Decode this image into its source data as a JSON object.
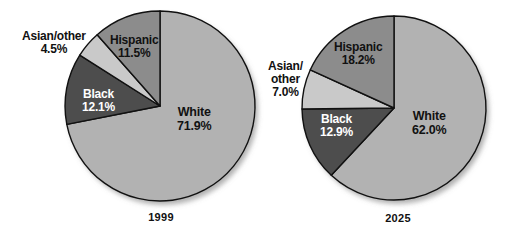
{
  "figure": {
    "background": "#ffffff",
    "width": 513,
    "height": 239
  },
  "palette": {
    "white_slice": "#b2b2b2",
    "hispanic_slice": "#8c8c8c",
    "asian_other_slice": "#c9c9c9",
    "black_slice": "#4d4d4d",
    "outline": "#111111",
    "label_dark": "#111111",
    "label_light": "#ffffff"
  },
  "chart_data": [
    {
      "type": "pie",
      "title": "1999",
      "categories": [
        "White",
        "Black",
        "Asian/other",
        "Hispanic"
      ],
      "values": [
        71.9,
        12.1,
        4.5,
        11.5
      ],
      "labels": [
        "71.9%",
        "12.1%",
        "4.5%",
        "11.5%"
      ],
      "colors": [
        "#b2b2b2",
        "#4d4d4d",
        "#c9c9c9",
        "#8c8c8c"
      ],
      "start_angle_deg": 0,
      "direction": "clockwise",
      "legend": "none",
      "grid": false
    },
    {
      "type": "pie",
      "title": "2025",
      "categories": [
        "White",
        "Black",
        "Asian/other",
        "Hispanic"
      ],
      "values": [
        62.0,
        12.9,
        7.0,
        18.2
      ],
      "labels": [
        "62.0%",
        "12.9%",
        "7.0%",
        "18.2%"
      ],
      "colors": [
        "#b2b2b2",
        "#4d4d4d",
        "#c9c9c9",
        "#8c8c8c"
      ],
      "start_angle_deg": 0,
      "direction": "clockwise",
      "legend": "none",
      "grid": false
    }
  ],
  "pie1": {
    "year": "1999",
    "white_name": "White",
    "white_pct": "71.9%",
    "black_name": "Black",
    "black_pct": "12.1%",
    "asian_name": "Asian/other",
    "asian_pct": "4.5%",
    "hispanic_name": "Hispanic",
    "hispanic_pct": "11.5%"
  },
  "pie2": {
    "year": "2025",
    "white_name": "White",
    "white_pct": "62.0%",
    "black_name": "Black",
    "black_pct": "12.9%",
    "asian_name_line1": "Asian/",
    "asian_name_line2": "other",
    "asian_pct": "7.0%",
    "hispanic_name": "Hispanic",
    "hispanic_pct": "18.2%"
  }
}
